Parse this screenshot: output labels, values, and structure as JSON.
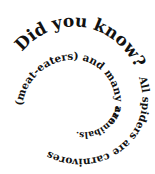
{
  "spiral_text": {
    "full": "Did you know? All spiders are carnivores (meat-eaters) and many are cannibals.",
    "heading": "Did you know?",
    "segment_1": "All spiders are carnivores",
    "segment_2": "(meat-eaters) and many are",
    "segment_3": "cannibals.",
    "color": "#111111",
    "background": "#ffffff"
  }
}
